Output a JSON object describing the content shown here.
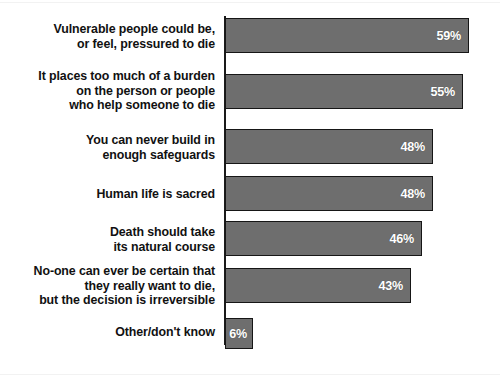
{
  "chart_data": {
    "type": "bar",
    "orientation": "horizontal",
    "title": "",
    "subtitle": "",
    "xlabel": "",
    "ylabel": "",
    "xlim": [
      0,
      60
    ],
    "grid": false,
    "legend": false,
    "value_suffix": "%",
    "bar_color": "#6e6e6e",
    "bar_border_color": "#161616",
    "value_label_color": "#ffffff",
    "category_label_color": "#111111",
    "categories": [
      "Vulnerable people could be,\nor feel, pressured to die",
      "It places too much of a burden\non the person or people\nwho help someone to die",
      "You can never build in\nenough safeguards",
      "Human life is sacred",
      "Death should take\nits natural course",
      "No-one can ever be certain that\nthey really want to die,\nbut the decision is irreversible",
      "Other/don't know"
    ],
    "values": [
      59,
      55,
      48,
      48,
      46,
      43,
      6
    ],
    "value_labels": [
      "59%",
      "55%",
      "48%",
      "48%",
      "46%",
      "43%",
      "6%"
    ]
  },
  "bars": [
    {
      "label": "Vulnerable people could be,\nor feel, pressured to die",
      "value_label": "59%",
      "value": 59,
      "top": 18,
      "height": 35,
      "width": 244,
      "label_top": 22
    },
    {
      "label": "It places too much of a burden\non the person or people\nwho help someone to die",
      "value_label": "55%",
      "value": 55,
      "top": 74,
      "height": 35,
      "width": 238,
      "label_top": 69
    },
    {
      "label": "You can never build in\nenough safeguards",
      "value_label": "48%",
      "value": 48,
      "top": 129,
      "height": 35,
      "width": 208,
      "label_top": 133
    },
    {
      "label": "Human life is sacred",
      "value_label": "48%",
      "value": 48,
      "top": 176,
      "height": 35,
      "width": 208,
      "label_top": 187
    },
    {
      "label": "Death should take\nits natural course",
      "value_label": "46%",
      "value": 46,
      "top": 221,
      "height": 35,
      "width": 197,
      "label_top": 225
    },
    {
      "label": "No-one can ever be certain that\nthey really want to die,\nbut the decision is irreversible",
      "value_label": "43%",
      "value": 43,
      "top": 268,
      "height": 35,
      "width": 186,
      "label_top": 264
    },
    {
      "label": "Other/don't know",
      "value_label": "6%",
      "value": 6,
      "top": 318,
      "height": 31,
      "width": 28,
      "label_top": 325
    }
  ]
}
